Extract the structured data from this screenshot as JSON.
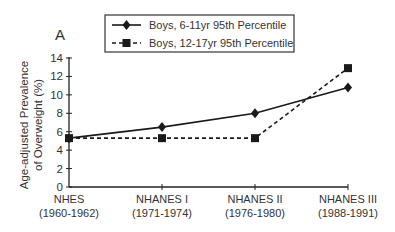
{
  "panel_label": "A",
  "chart_data": {
    "type": "line",
    "title": "",
    "xlabel": "",
    "ylabel_lines": [
      "Age-adjusted Prevalence",
      "of Overweight (%)"
    ],
    "ylabel": "Age-adjusted Prevalence of Overweight (%)",
    "categories": [
      {
        "name": "NHES",
        "years": "(1960-1962)"
      },
      {
        "name": "NHANES I",
        "years": "(1971-1974)"
      },
      {
        "name": "NHANES II",
        "years": "(1976-1980)"
      },
      {
        "name": "NHANES III",
        "years": "(1988-1991)"
      }
    ],
    "ylim": [
      0,
      14
    ],
    "yticks": [
      0,
      2,
      4,
      6,
      8,
      10,
      12,
      14
    ],
    "grid": false,
    "legend_position": "top-center",
    "series": [
      {
        "name": "Boys, 6-11yr 95th Percentile",
        "marker": "diamond",
        "line_style": "solid",
        "color": "#1a1a1a",
        "values": [
          5.3,
          6.5,
          8.0,
          10.8
        ]
      },
      {
        "name": "Boys, 12-17yr 95th Percentile",
        "marker": "square",
        "line_style": "dashed",
        "color": "#1a1a1a",
        "values": [
          5.3,
          5.3,
          5.3,
          12.9
        ]
      }
    ]
  }
}
